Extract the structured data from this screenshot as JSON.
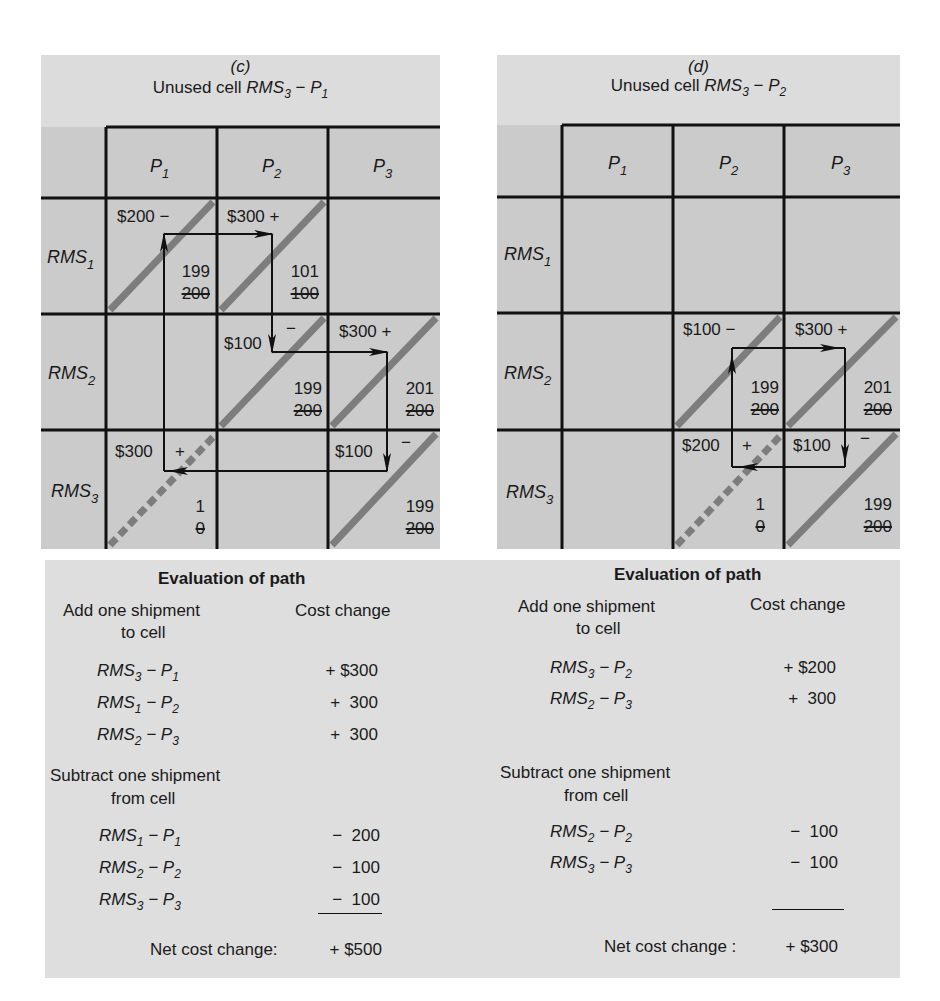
{
  "panels": [
    {
      "id": "c",
      "label": "(c)",
      "title_prefix": "Unused cell ",
      "title_rms": "RMS",
      "title_rms_sub": "3",
      "title_dash": " − ",
      "title_p": "P",
      "title_p_sub": "1",
      "columns": [
        {
          "name": "P",
          "sub": "1"
        },
        {
          "name": "P",
          "sub": "2"
        },
        {
          "name": "P",
          "sub": "3"
        }
      ],
      "rows": [
        {
          "name": "RMS",
          "sub": "1"
        },
        {
          "name": "RMS",
          "sub": "2"
        },
        {
          "name": "RMS",
          "sub": "3"
        }
      ],
      "cells": {
        "r1c1": {
          "cost": "$200",
          "sign": "−",
          "new": "199",
          "old": "200"
        },
        "r1c2": {
          "cost": "$300",
          "sign": "+",
          "new": "101",
          "old": "100"
        },
        "r2c2": {
          "cost": "$100",
          "sign": "−",
          "new": "199",
          "old": "200"
        },
        "r2c3": {
          "cost": "$300",
          "sign": "+",
          "new": "201",
          "old": "200"
        },
        "r3c1": {
          "cost": "$300",
          "sign": "+",
          "new": "1",
          "old": "0"
        },
        "r3c3": {
          "cost": "$100",
          "sign": "−",
          "new": "199",
          "old": "200"
        }
      }
    },
    {
      "id": "d",
      "label": "(d)",
      "title_prefix": "Unused cell ",
      "title_rms": "RMS",
      "title_rms_sub": "3",
      "title_dash": " − ",
      "title_p": "P",
      "title_p_sub": "2",
      "columns": [
        {
          "name": "P",
          "sub": "1"
        },
        {
          "name": "P",
          "sub": "2"
        },
        {
          "name": "P",
          "sub": "3"
        }
      ],
      "rows": [
        {
          "name": "RMS",
          "sub": "1"
        },
        {
          "name": "RMS",
          "sub": "2"
        },
        {
          "name": "RMS",
          "sub": "3"
        }
      ],
      "cells": {
        "r2c2": {
          "cost": "$100",
          "sign": "−",
          "new": "199",
          "old": "200"
        },
        "r2c3": {
          "cost": "$300",
          "sign": "+",
          "new": "201",
          "old": "200"
        },
        "r3c2": {
          "cost": "$200",
          "sign": "+",
          "new": "1",
          "old": "0"
        },
        "r3c3": {
          "cost": "$100",
          "sign": "−",
          "new": "199",
          "old": "200"
        }
      }
    }
  ],
  "evaluations": [
    {
      "heading": "Evaluation  of  path",
      "add_label_1": "Add one shipment",
      "add_label_2": "to cell",
      "cost_header": "Cost change",
      "add_rows": [
        {
          "rms_sub": "3",
          "p_sub": "1",
          "value": "+ $300"
        },
        {
          "rms_sub": "1",
          "p_sub": "2",
          "value": "+  300"
        },
        {
          "rms_sub": "2",
          "p_sub": "3",
          "value": "+  300"
        }
      ],
      "sub_label_1": "Subtract one shipment",
      "sub_label_2": "from cell",
      "sub_rows": [
        {
          "rms_sub": "1",
          "p_sub": "1",
          "value": "−  200"
        },
        {
          "rms_sub": "2",
          "p_sub": "2",
          "value": "−  100"
        },
        {
          "rms_sub": "3",
          "p_sub": "3",
          "value": "−  100"
        }
      ],
      "net_label": "Net cost change:",
      "net_value": "+ $500"
    },
    {
      "heading": "Evaluation  of  path",
      "add_label_1": "Add one shipment",
      "add_label_2": "to cell",
      "cost_header": "Cost change",
      "add_rows": [
        {
          "rms_sub": "3",
          "p_sub": "2",
          "value": "+ $200"
        },
        {
          "rms_sub": "2",
          "p_sub": "3",
          "value": "+  300"
        }
      ],
      "sub_label_1": "Subtract one shipment",
      "sub_label_2": "from cell",
      "sub_rows": [
        {
          "rms_sub": "2",
          "p_sub": "2",
          "value": "−  100"
        },
        {
          "rms_sub": "3",
          "p_sub": "3",
          "value": "−  100"
        }
      ],
      "net_label": "Net cost change :",
      "net_value": "+ $300"
    }
  ],
  "symbols": {
    "rms": "RMS",
    "p": "P",
    "dash": " − "
  },
  "colors": {
    "panel_bg": "#dcdcdc",
    "cell_bg": "#cbcbcb",
    "grid_line": "#111111",
    "stripe": "#7a7a7a",
    "eval_bg": "#dedede"
  }
}
